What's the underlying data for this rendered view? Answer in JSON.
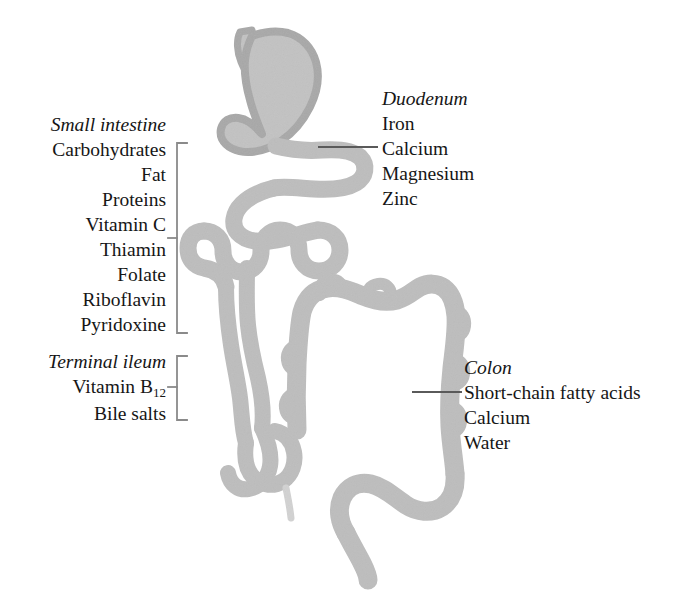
{
  "diagram": {
    "colors": {
      "organ_fill": "#c2c2c2",
      "organ_stroke": "#a8a8a8",
      "text": "#161616",
      "leader_line": "#5a5a5a",
      "bracket": "#8a8a8a",
      "background": "#ffffff"
    },
    "organs": [
      "stomach",
      "duodenum",
      "jejunum",
      "ileum",
      "terminal-ileum",
      "cecum",
      "appendix",
      "ascending-colon",
      "transverse-colon",
      "descending-colon",
      "sigmoid-colon",
      "rectum"
    ]
  },
  "labels": {
    "small_intestine": {
      "heading": "Small intestine",
      "items": [
        "Carbohydrates",
        "Fat",
        "Proteins",
        "Vitamin C",
        "Thiamin",
        "Folate",
        "Riboflavin",
        "Pyridoxine"
      ]
    },
    "terminal_ileum": {
      "heading": "Terminal ileum",
      "items": [
        "Vitamin B",
        "Bile salts"
      ],
      "vitamin_b_subscript": "12"
    },
    "duodenum": {
      "heading": "Duodenum",
      "items": [
        "Iron",
        "Calcium",
        "Magnesium",
        "Zinc"
      ]
    },
    "colon": {
      "heading": "Colon",
      "items": [
        "Short-chain fatty acids",
        "Calcium",
        "Water"
      ]
    }
  }
}
